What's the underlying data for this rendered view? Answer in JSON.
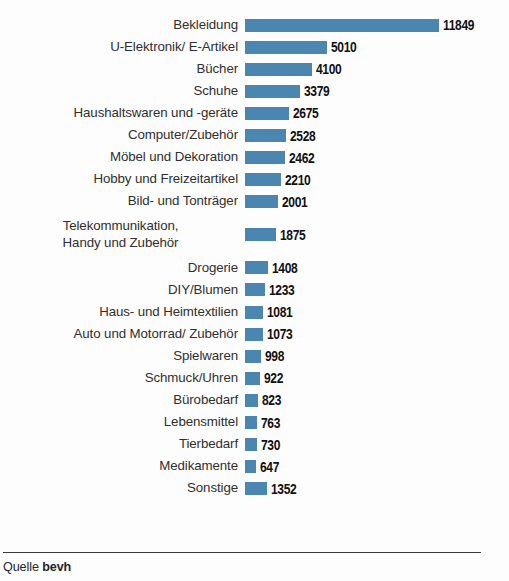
{
  "chart_data": {
    "type": "bar",
    "orientation": "horizontal",
    "title": "",
    "xlabel": "",
    "ylabel": "",
    "grid": false,
    "legend": null,
    "xlim": [
      0,
      11849
    ],
    "value_labels": true,
    "bar_color": "#4a86b0",
    "categories": [
      "Bekleidung",
      "U-Elektronik/ E-Artikel",
      "Bücher",
      "Schuhe",
      "Haushaltswaren und -geräte",
      "Computer/Zubehör",
      "Möbel und Dekoration",
      "Hobby und Freizeitartikel",
      "Bild- und Tonträger",
      "Telekommunikation,\nHandy und Zubehör",
      "Drogerie",
      "DIY/Blumen",
      "Haus- und Heimtextilien",
      "Auto und Motorrad/ Zubehör",
      "Spielwaren",
      "Schmuck/Uhren",
      "Bürobedarf",
      "Lebensmittel",
      "Tierbedarf",
      "Medikamente",
      "Sonstige"
    ],
    "values": [
      11849,
      5010,
      4100,
      3379,
      2675,
      2528,
      2462,
      2210,
      2001,
      1875,
      1408,
      1233,
      1081,
      1073,
      998,
      922,
      823,
      763,
      730,
      647,
      1352
    ],
    "value_text": [
      "11849",
      "5010",
      "4100",
      "3379",
      "2675",
      "2528",
      "2462",
      "2210",
      "2001",
      "1875",
      "1408",
      "1233",
      "1081",
      "1073",
      "998",
      "922",
      "823",
      "763",
      "730",
      "647",
      "1352"
    ]
  },
  "title_remnant": "",
  "footer": {
    "source_prefix": "Quelle",
    "source_name": "bevh"
  }
}
